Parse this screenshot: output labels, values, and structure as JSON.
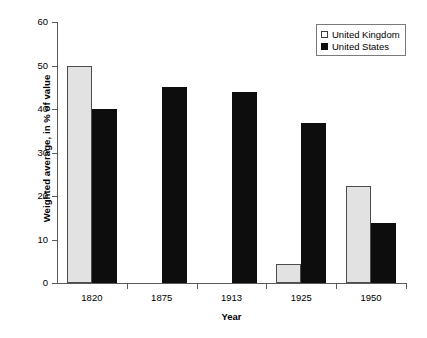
{
  "chart_data": {
    "type": "bar",
    "title": "",
    "xlabel": "Year",
    "ylabel": "Weighted average, in % of value",
    "categories": [
      "1820",
      "1875",
      "1913",
      "1925",
      "1950"
    ],
    "series": [
      {
        "name": "United Kingdom",
        "color": "#e2e2e2",
        "values": [
          50.0,
          null,
          null,
          4.4,
          22.3
        ]
      },
      {
        "name": "United States",
        "color": "#0d0d0d",
        "values": [
          40.0,
          45.0,
          44.0,
          36.8,
          13.7
        ]
      }
    ],
    "ylim": [
      0,
      60
    ],
    "yticks": [
      0,
      10,
      20,
      30,
      40,
      50,
      60
    ],
    "ytick_labels": [
      "0",
      "10",
      "20",
      "30",
      "40",
      "50",
      "60"
    ],
    "grid": false,
    "legend_position": "top-right",
    "legend_entries": [
      "United Kingdom",
      "United States"
    ]
  }
}
